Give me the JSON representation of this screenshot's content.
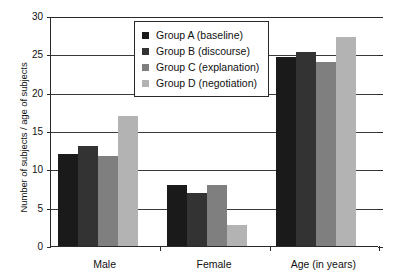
{
  "chart_data": {
    "type": "bar",
    "title": "",
    "subtitle": "",
    "xlabel": "",
    "ylabel": "Number of subjects / age of subjects",
    "categories": [
      "Male",
      "Female",
      "Age (in years)"
    ],
    "series": [
      {
        "name": "Group A (baseline)",
        "short": "Group A",
        "condition": "baseline",
        "color": "#1a1a1a",
        "values": [
          12.0,
          8.0,
          24.7
        ]
      },
      {
        "name": "Group B (discourse)",
        "short": "Group B",
        "condition": "discourse",
        "color": "#333333",
        "values": [
          13.0,
          6.9,
          25.3
        ]
      },
      {
        "name": "Group C (explanation)",
        "short": "Group C",
        "condition": "explanation",
        "color": "#7f7f7f",
        "values": [
          11.8,
          8.0,
          24.0
        ]
      },
      {
        "name": "Group D (negotiation)",
        "short": "Group D",
        "condition": "negotiation",
        "color": "#b3b3b3",
        "values": [
          16.9,
          2.7,
          27.3
        ]
      }
    ],
    "ylim": [
      0,
      30
    ],
    "yticks": [
      "0",
      "5",
      "10",
      "15",
      "20",
      "25",
      "30"
    ],
    "ytick_values": [
      0,
      5,
      10,
      15,
      20,
      25,
      30
    ],
    "grid": true,
    "grid_axis": "y",
    "legend_position": "top-center",
    "legend_entries": [
      "Group A (baseline)",
      "Group B (discourse)",
      "Group C (explanation)",
      "Group D (negotiation)"
    ],
    "colors": {
      "group_a": "#1a1a1a",
      "group_b": "#333333",
      "group_c": "#7f7f7f",
      "group_d": "#b3b3b3",
      "axis": "#2a2a2a",
      "grid": "#3a3a3a",
      "background": "#ffffff",
      "text": "#111111"
    }
  }
}
